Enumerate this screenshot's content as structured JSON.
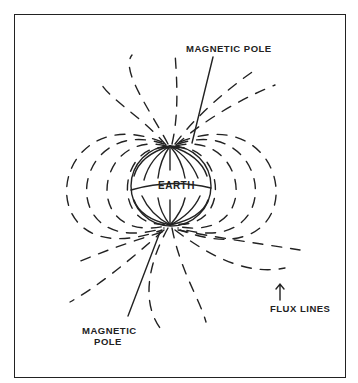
{
  "diagram": {
    "earth_label": "EARTH",
    "labels": {
      "north_pole": "MAGNETIC POLE",
      "south_pole_line1": "MAGNETIC",
      "south_pole_line2": "POLE",
      "flux_lines": "FLUX LINES"
    },
    "colors": {
      "ink": "#222222",
      "background": "#ffffff"
    }
  }
}
